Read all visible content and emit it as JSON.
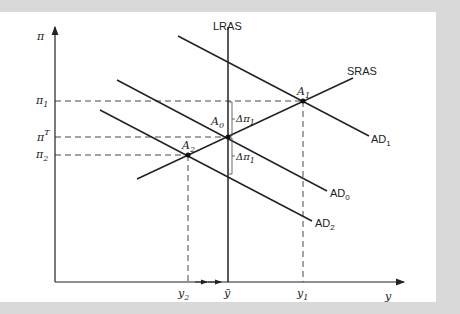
{
  "diagram": {
    "type": "AD-AS macroeconomic model",
    "axes": {
      "y_axis_label": "π",
      "x_axis_label": "y"
    },
    "curves": [
      {
        "id": "LRAS",
        "label": "LRAS"
      },
      {
        "id": "SRAS",
        "label": "SRAS"
      },
      {
        "id": "AD0",
        "label": "AD",
        "subscript": "0"
      },
      {
        "id": "AD1",
        "label": "AD",
        "subscript": "1"
      },
      {
        "id": "AD2",
        "label": "AD",
        "subscript": "2"
      }
    ],
    "points": [
      {
        "id": "A0",
        "label": "A",
        "subscript": "0"
      },
      {
        "id": "A1",
        "label": "A",
        "subscript": "1"
      },
      {
        "id": "A2",
        "label": "A",
        "subscript": "2"
      }
    ],
    "y_ticks": [
      {
        "id": "pi1",
        "label": "π",
        "subscript": "1"
      },
      {
        "id": "pi_target",
        "label": "π",
        "superscript": "T"
      },
      {
        "id": "pi2",
        "label": "π",
        "subscript": "2"
      }
    ],
    "x_ticks": [
      {
        "id": "y2",
        "label": "y",
        "subscript": "2"
      },
      {
        "id": "ybar",
        "label": "ȳ"
      },
      {
        "id": "y1",
        "label": "y",
        "subscript": "1"
      }
    ],
    "annotations": [
      {
        "id": "delta_up",
        "label": "Δπ",
        "subscript": "1"
      },
      {
        "id": "delta_down",
        "label": "Δπ",
        "subscript": "1"
      }
    ]
  }
}
